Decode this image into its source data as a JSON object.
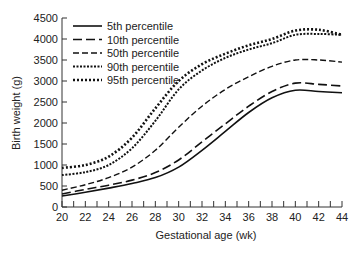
{
  "chart_data": {
    "type": "line",
    "title": "",
    "xlabel": "Gestational age (wk)",
    "ylabel": "Birth weight (g)",
    "xlim": [
      20,
      44
    ],
    "ylim": [
      0,
      4500
    ],
    "x_ticks": [
      20,
      22,
      24,
      26,
      28,
      30,
      32,
      34,
      36,
      38,
      40,
      42,
      44
    ],
    "y_ticks": [
      0,
      500,
      1000,
      1500,
      2000,
      2500,
      3000,
      3500,
      4000,
      4500
    ],
    "grid": false,
    "legend_position": "upper left",
    "x": [
      20,
      22,
      24,
      26,
      28,
      30,
      32,
      34,
      36,
      38,
      40,
      42,
      44
    ],
    "series": [
      {
        "name": "5th percentile",
        "style": "solid",
        "values": [
          260,
          350,
          450,
          560,
          700,
          950,
          1350,
          1800,
          2250,
          2600,
          2780,
          2750,
          2720
        ]
      },
      {
        "name": "10th percentile",
        "style": "longdash",
        "values": [
          310,
          420,
          520,
          640,
          820,
          1120,
          1550,
          1980,
          2400,
          2750,
          2950,
          2920,
          2880
        ]
      },
      {
        "name": "50th percentile",
        "style": "dash",
        "values": [
          400,
          530,
          700,
          950,
          1350,
          1900,
          2400,
          2800,
          3100,
          3350,
          3500,
          3500,
          3450
        ]
      },
      {
        "name": "90th percentile",
        "style": "shortdot",
        "values": [
          760,
          830,
          1000,
          1400,
          2050,
          2800,
          3250,
          3550,
          3750,
          3900,
          4100,
          4120,
          4100
        ]
      },
      {
        "name": "95th percentile",
        "style": "dot",
        "values": [
          930,
          1000,
          1200,
          1650,
          2350,
          3000,
          3400,
          3650,
          3850,
          4000,
          4200,
          4220,
          4100
        ]
      }
    ]
  }
}
